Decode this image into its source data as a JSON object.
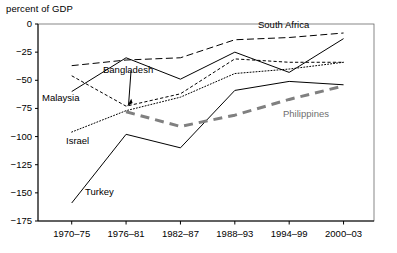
{
  "chart_data": {
    "type": "line",
    "title": "percent of GDP",
    "xlabel": "",
    "ylabel": "percent of GDP",
    "ylim": [
      -175,
      0
    ],
    "yticks": [
      0,
      -25,
      -50,
      -75,
      -100,
      -125,
      -150,
      -175
    ],
    "ytick_labels": [
      "0",
      "−25",
      "−50",
      "−75",
      "−100",
      "−125",
      "−150",
      "−175"
    ],
    "categories": [
      "1970–75",
      "1976–81",
      "1982–87",
      "1988–93",
      "1994–99",
      "2000–03"
    ],
    "grid": false,
    "legend_position": "inline-annotations",
    "series": [
      {
        "name": "Malaysia",
        "style": "solid",
        "color": "#000000",
        "width": 1,
        "values": [
          -60,
          -30,
          -49,
          -25,
          -43,
          -13
        ]
      },
      {
        "name": "South Africa",
        "style": "dashed",
        "color": "#000000",
        "width": 1,
        "values": [
          -37,
          -32,
          -30,
          -14,
          -12,
          -8
        ]
      },
      {
        "name": "Bangladesh",
        "style": "fine-dash",
        "color": "#000000",
        "width": 1,
        "values": [
          -46,
          -73,
          -62,
          -31,
          -34,
          -34
        ]
      },
      {
        "name": "Israel",
        "style": "dotted",
        "color": "#000000",
        "width": 1,
        "values": [
          -96,
          -77,
          -65,
          -44,
          -40,
          -34
        ]
      },
      {
        "name": "Turkey",
        "style": "solid",
        "color": "#000000",
        "width": 1,
        "values": [
          -159,
          -98,
          -110,
          -59,
          -51,
          -54
        ]
      },
      {
        "name": "Philippines",
        "style": "thick-dashed",
        "color": "#808080",
        "width": 3,
        "values": [
          null,
          -78,
          -91,
          -81,
          -67,
          -55
        ]
      }
    ],
    "annotations": [
      {
        "text": "South Africa",
        "series": "South Africa"
      },
      {
        "text": "Bangladesh",
        "series": "Bangladesh",
        "has_arrow": true
      },
      {
        "text": "Malaysia",
        "series": "Malaysia"
      },
      {
        "text": "Israel",
        "series": "Israel"
      },
      {
        "text": "Turkey",
        "series": "Turkey"
      },
      {
        "text": "Philippines",
        "series": "Philippines"
      }
    ]
  }
}
